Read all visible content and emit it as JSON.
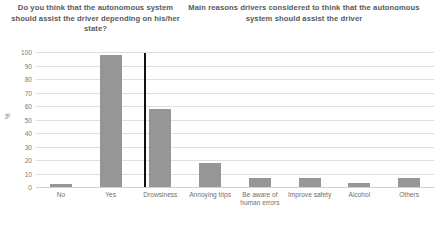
{
  "titles": {
    "left": "Do you think that the autonomous system should assist the driver depending on his/her state?",
    "right": "Main reasons drivers considered to think that the autonomous system should assist the driver"
  },
  "chart_data": {
    "type": "bar",
    "title": "",
    "xlabel": "",
    "ylabel": "%",
    "ylim": [
      0,
      100
    ],
    "ytick_step": 10,
    "yticks": [
      0,
      10,
      20,
      30,
      40,
      50,
      60,
      70,
      80,
      90,
      100
    ],
    "grid": true,
    "legend": "none",
    "bar_color": "#969696",
    "gridline_color": "#dfdfdf",
    "divider_color": "#111111",
    "divider_after_index": 1,
    "categories": [
      "No",
      "Yes",
      "Drowsiness",
      "Annoying trips",
      "Be aware of human errors",
      "Improve safety",
      "Alcohol",
      "Others"
    ],
    "values": [
      2,
      98,
      58,
      18,
      7,
      7,
      3,
      7
    ],
    "groups": [
      {
        "name": "Do you think that the autonomous system should assist the driver depending on his/her state?",
        "categories": [
          "No",
          "Yes"
        ],
        "values": [
          2,
          98
        ]
      },
      {
        "name": "Main reasons drivers considered to think that the autonomous system should assist the driver",
        "categories": [
          "Drowsiness",
          "Annoying trips",
          "Be aware of human errors",
          "Improve safety",
          "Alcohol",
          "Others"
        ],
        "values": [
          58,
          18,
          7,
          7,
          3,
          7
        ]
      }
    ]
  }
}
